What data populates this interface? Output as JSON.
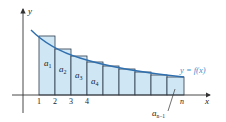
{
  "diagram": {
    "title": "",
    "axes": {
      "x_label": "x",
      "y_label": "y"
    },
    "curve_label": "y = f(x)",
    "tick_labels": [
      "1",
      "2",
      "3",
      "4",
      "n"
    ],
    "term_labels": {
      "a1": {
        "base": "a",
        "sub": "1"
      },
      "a2": {
        "base": "a",
        "sub": "2"
      },
      "a3": {
        "base": "a",
        "sub": "3"
      },
      "a4": {
        "base": "a",
        "sub": "4"
      },
      "an1": {
        "base": "a",
        "sub": "n−1"
      }
    },
    "colors": {
      "rect_fill": "#cfe6f5",
      "rect_stroke": "#2b3a4a",
      "curve": "#2f6fae",
      "curve_label": "#3a8fd0",
      "axis": "#333333"
    }
  }
}
